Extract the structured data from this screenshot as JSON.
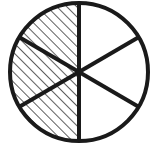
{
  "figure": {
    "name": "hatched-circle-sectors",
    "background_color": "#ffffff",
    "stroke_color": "#1a1a1a",
    "hatch_color": "#1a1a1a",
    "outline_width": 4,
    "spoke_width": 4,
    "hatch_width": 1.4,
    "hatch_spacing": 7,
    "hatch_angle_deg": 45,
    "total_sectors": 6,
    "shaded_sectors": 3,
    "unshaded_sectors": 3,
    "fraction_shaded": "3/6",
    "circle": {
      "center_x": 79,
      "center_y": 72,
      "radius_x": 69,
      "radius_y": 69
    },
    "diameters": [
      {
        "name": "vertical-diameter",
        "angle_deg": 90,
        "x1": 79,
        "y1": 3,
        "x2": 79,
        "y2": 141
      },
      {
        "name": "upper-left-to-lower-right-diameter",
        "angle_deg": 30,
        "x1": 19,
        "y1": 37,
        "x2": 139,
        "y2": 107
      },
      {
        "name": "lower-left-to-upper-right-diameter",
        "angle_deg": 150,
        "x1": 19,
        "y1": 107,
        "x2": 139,
        "y2": 37
      }
    ],
    "sectors": [
      {
        "name": "sector-top-left",
        "start_deg": 90,
        "end_deg": 150,
        "shaded": true
      },
      {
        "name": "sector-mid-left",
        "start_deg": 150,
        "end_deg": 210,
        "shaded": true
      },
      {
        "name": "sector-bottom-left",
        "start_deg": 210,
        "end_deg": 270,
        "shaded": true
      },
      {
        "name": "sector-bottom-right",
        "start_deg": 270,
        "end_deg": 330,
        "shaded": false
      },
      {
        "name": "sector-mid-right",
        "start_deg": 330,
        "end_deg": 30,
        "shaded": false
      },
      {
        "name": "sector-top-right",
        "start_deg": 30,
        "end_deg": 90,
        "shaded": false
      }
    ]
  }
}
